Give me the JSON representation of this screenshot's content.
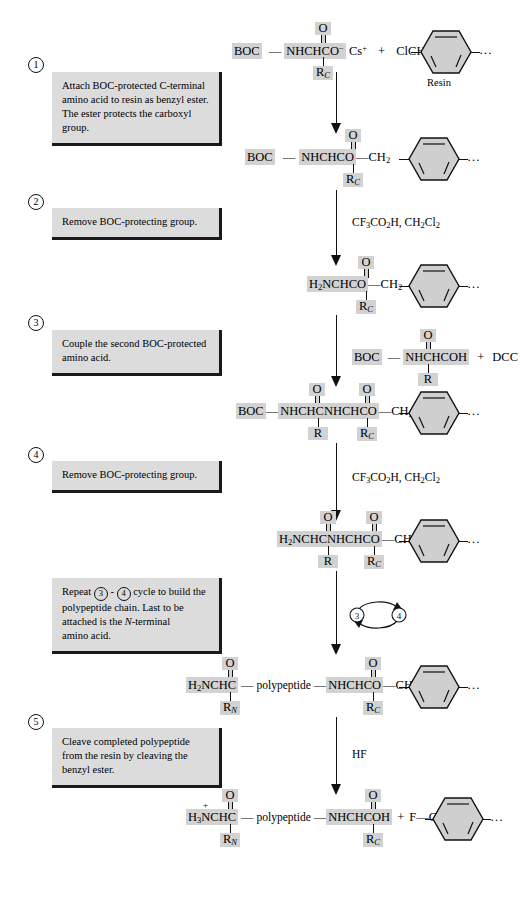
{
  "steps": [
    {
      "number": "1",
      "marker": "①",
      "lines": [
        "Attach BOC-protected C-terminal",
        "amino acid to resin as benzyl ester.",
        "The ester protects the carboxyl group."
      ],
      "italic_terms": [
        "C"
      ]
    },
    {
      "number": "2",
      "marker": "②",
      "lines": [
        "Remove BOC-protecting group."
      ],
      "italic_terms": []
    },
    {
      "number": "3",
      "marker": "③",
      "lines": [
        "Couple the second BOC-protected",
        "amino acid."
      ],
      "italic_terms": []
    },
    {
      "number": "4",
      "marker": "④",
      "lines": [
        "Remove BOC-protecting group."
      ],
      "italic_terms": []
    },
    {
      "number": "repeat",
      "marker": "",
      "lines": [
        "Repeat ③ - ④ cycle to build the",
        "polypeptide chain. Last to be",
        "attached is the N-terminal",
        "amino acid."
      ],
      "italic_terms": [
        "N"
      ]
    },
    {
      "number": "5",
      "marker": "⑤",
      "lines": [
        "Cleave completed polypeptide",
        "from the resin by cleaving the",
        "benzyl ester."
      ],
      "italic_terms": []
    }
  ],
  "reagents": [
    {
      "id": "tfa-1",
      "text": "CF3CO2H, CH2Cl2"
    },
    {
      "id": "dcc",
      "text": "DCC"
    },
    {
      "id": "tfa-2",
      "text": "CF3CO2H, CH2Cl2"
    },
    {
      "id": "hf",
      "text": "HF"
    }
  ],
  "labels": {
    "resin": "Resin",
    "polypeptide": "polypeptide",
    "plus": "+",
    "ellipsis": "…"
  },
  "structures": {
    "row1": {
      "boc": "BOC",
      "core": "NHCHCO",
      "core_charge": "−",
      "counterion": "Cs+",
      "carbonyl": "O",
      "r_group": "RC",
      "reactant2": "ClCH2",
      "resin_label": "Resin"
    },
    "row2": {
      "boc": "BOC",
      "core": "NHCHCO",
      "carbonyl": "O",
      "r_group": "RC",
      "linker": "CH2"
    },
    "row3": {
      "core": "H2NCHCO",
      "carbonyl": "O",
      "r_group": "RC",
      "linker": "CH2"
    },
    "row4_side": {
      "boc": "BOC",
      "core": "NHCHCOH",
      "carbonyl": "O",
      "r_group": "R",
      "plus": "+",
      "coupler": "DCC"
    },
    "row5": {
      "boc": "BOC",
      "core": "NHCHCNHCHCO",
      "carbonyl1": "O",
      "carbonyl2": "O",
      "r_group1": "R",
      "r_group2": "RC",
      "linker": "CH2"
    },
    "row6": {
      "core": "H2NCHCNHCHCO",
      "carbonyl1": "O",
      "carbonyl2": "O",
      "r_group1": "R",
      "r_group2": "RC",
      "linker": "CH2"
    },
    "row7": {
      "left_core": "H2NCHC",
      "left_carbonyl": "O",
      "left_r": "RN",
      "middle": "polypeptide",
      "right_core": "NHCHCO",
      "right_carbonyl": "O",
      "right_r": "RC",
      "linker": "CH2"
    },
    "row8": {
      "left_core": "H3NCHC",
      "left_charge": "+",
      "left_carbonyl": "O",
      "left_r": "RN",
      "middle": "polypeptide",
      "right_core": "NHCHCOH",
      "right_carbonyl": "O",
      "right_r": "RC",
      "plus": "+",
      "fluoride": "F",
      "linker": "CH2"
    }
  },
  "cycle": {
    "from": "③",
    "to": "④"
  },
  "colors": {
    "highlight": "#d2d2d2",
    "callout_bg": "#dcdcdc",
    "shadow": "#1a1a1a",
    "ink": "#000000"
  }
}
